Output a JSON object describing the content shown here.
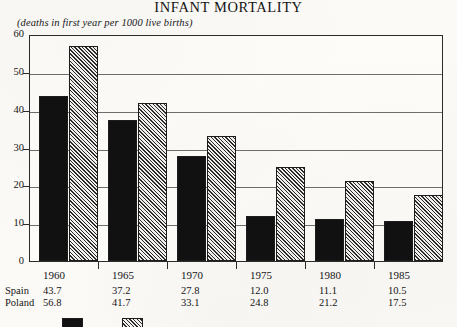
{
  "chart_data": {
    "type": "bar",
    "title": "INFANT MORTALITY",
    "subtitle": "(deaths in first year per 1000 live births)",
    "xlabel": "",
    "ylabel": "",
    "ylim": [
      0,
      60
    ],
    "ytick_step": 10,
    "yticks": [
      "60",
      "50",
      "40",
      "30",
      "20",
      "10",
      "0"
    ],
    "grid": true,
    "legend_position": "bottom-left",
    "categories": [
      "1960",
      "1965",
      "1970",
      "1975",
      "1980",
      "1985"
    ],
    "series": [
      {
        "name": "Spain",
        "fill": "solid-black",
        "color": "#111111",
        "values": [
          43.7,
          37.2,
          27.8,
          12.0,
          11.1,
          10.5
        ],
        "labels": [
          "43.7",
          "37.2",
          "27.8",
          "12.0",
          "11.1",
          "10.5"
        ]
      },
      {
        "name": "Poland",
        "fill": "diagonal-hatch",
        "color": "#2a2a2a",
        "values": [
          56.8,
          41.7,
          33.1,
          24.8,
          21.2,
          17.5
        ],
        "labels": [
          "56.8",
          "41.7",
          "33.1",
          "24.8",
          "21.2",
          "17.5"
        ]
      }
    ]
  },
  "table": {
    "row_labels": [
      "Spain",
      "Poland"
    ]
  },
  "legend": {
    "entries": [
      {
        "label": "Spain",
        "swatch": "solid"
      },
      {
        "label": "Poland",
        "swatch": "hatch"
      }
    ]
  }
}
